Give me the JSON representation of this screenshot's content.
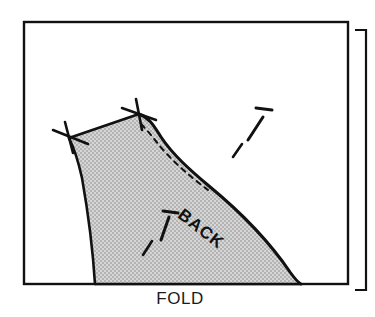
{
  "figure": {
    "kind": "line-drawing",
    "background_color": "#ffffff",
    "ink_color": "#111111",
    "shaded_fill_color": "#c8c8c8"
  },
  "labels": {
    "fold": "FOLD",
    "piece": "BACK"
  },
  "icons": {
    "grainline_upper": "grainline-arrow-icon",
    "grainline_lower": "grainline-arrow-icon",
    "notch_left": "notch-cross-icon",
    "notch_right": "notch-cross-icon"
  },
  "frame": {
    "main_sheet": "fabric-sheet-outline",
    "offset_sheet": "fabric-sheet-offset-outline"
  },
  "edges": {
    "shoulder": "shoulder-seam-line",
    "neckline": "neckline-curve",
    "armhole": "armhole-curve",
    "center_back": "center-back-edge",
    "stitch_guide": "dashed-stitch-line",
    "fold_edge": "fold-edge-line"
  }
}
